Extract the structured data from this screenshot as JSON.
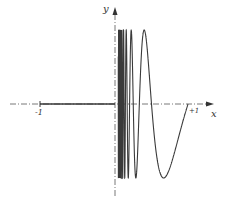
{
  "diagram": {
    "function": "y = sin(pi/x) for 0 < x <= 1, y = 0 for -1 <= x <= 0",
    "axes": {
      "x_label": "x",
      "y_label": "y",
      "ticks": [
        {
          "value": -1,
          "label": "-1"
        },
        {
          "value": 1,
          "label": "+1"
        }
      ]
    },
    "colors": {
      "curve": "#3a3a3a",
      "axis": "#555555",
      "background": "#ffffff"
    }
  }
}
